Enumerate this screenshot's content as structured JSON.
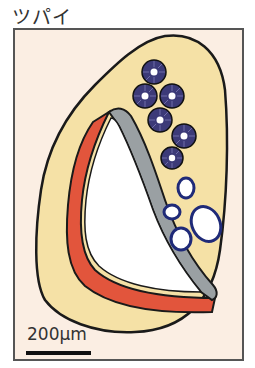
{
  "title": "ツパイ",
  "scale": {
    "label": "200μm"
  },
  "colors": {
    "background": "#fbeee3",
    "frame": "#555555",
    "tissue": "#f5e1a6",
    "outline": "#1a1a1a",
    "red_layer": "#e2553c",
    "gray_layer": "#9aa0a3",
    "lumen": "#ffffff",
    "cell_fill": "#3c3a78",
    "vessel_ring": "#1f2a78"
  },
  "diagram": {
    "subject": "ツパイ",
    "elements": [
      {
        "name": "outer-tissue",
        "shape": "teardrop"
      },
      {
        "name": "lumen",
        "shape": "crescent-cavity"
      },
      {
        "name": "red-layer",
        "position": "left-bottom wall"
      },
      {
        "name": "gray-layer",
        "position": "right-upper wall"
      },
      {
        "name": "dark-ring-cells",
        "count": 7
      },
      {
        "name": "open-vessels",
        "count": 4
      }
    ]
  }
}
